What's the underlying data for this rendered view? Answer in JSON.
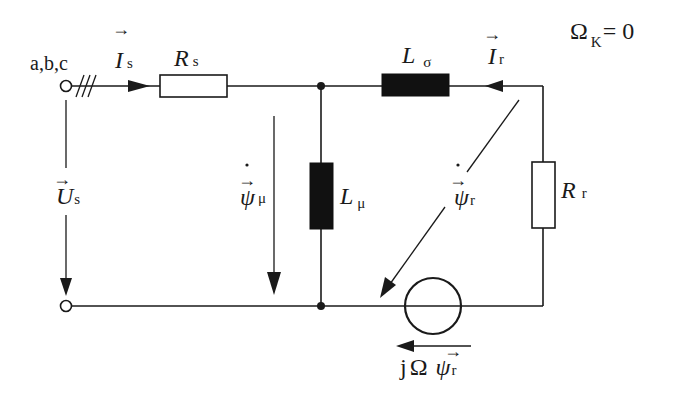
{
  "diagram": {
    "title_condition": {
      "symbol": "Ω",
      "subscript": "K",
      "equals": "= 0"
    },
    "terminal_label": "a,b,c",
    "phase_marks": "///",
    "labels": {
      "stator_current": {
        "symbol": "I",
        "subscript": "s",
        "vector": true
      },
      "stator_resistance": {
        "symbol": "R",
        "subscript": "s"
      },
      "leakage_inductance": {
        "symbol": "L",
        "subscript": "σ"
      },
      "rotor_current": {
        "symbol": "I",
        "subscript": "r",
        "vector": true
      },
      "magnetizing_inductance": {
        "symbol": "L",
        "subscript": "μ"
      },
      "rotor_resistance": {
        "symbol": "R",
        "subscript": "r"
      },
      "stator_voltage": {
        "symbol": "U",
        "subscript": "s",
        "vector": true
      },
      "magnetizing_flux_derivative": {
        "symbol": "ψ",
        "subscript": "μ",
        "vector": true,
        "dot": true
      },
      "rotor_flux_derivative": {
        "symbol": "ψ",
        "subscript": "r",
        "vector": true,
        "dot": true
      },
      "source_voltage": {
        "prefix": "j",
        "omega": "Ω",
        "symbol": "ψ",
        "subscript": "r",
        "vector": true
      }
    },
    "components": [
      {
        "id": "Rs",
        "type": "resistor",
        "orientation": "horizontal"
      },
      {
        "id": "Lsigma",
        "type": "inductor",
        "orientation": "horizontal"
      },
      {
        "id": "Lmu",
        "type": "inductor",
        "orientation": "vertical"
      },
      {
        "id": "Rr",
        "type": "resistor",
        "orientation": "vertical"
      },
      {
        "id": "source",
        "type": "voltage-source",
        "orientation": "horizontal"
      }
    ],
    "arrows": [
      {
        "id": "Is",
        "direction": "right"
      },
      {
        "id": "Ir",
        "direction": "left"
      },
      {
        "id": "Us",
        "direction": "down"
      },
      {
        "id": "psi_mu_dot",
        "direction": "down"
      },
      {
        "id": "psi_r_dot",
        "direction": "down-left"
      },
      {
        "id": "jOmega_psi_r",
        "direction": "left"
      }
    ]
  }
}
